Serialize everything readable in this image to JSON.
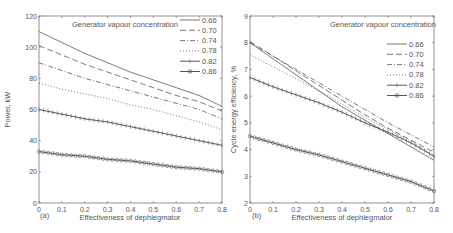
{
  "chart_data": [
    {
      "type": "line",
      "panel_label": "(a)",
      "title": "Generator vapour concentration",
      "xlabel": "Effectiveness of dephlegmator",
      "ylabel": "Power, kW",
      "xlim": [
        0,
        0.8
      ],
      "ylim": [
        0,
        120
      ],
      "xticks": [
        "0",
        "0.1",
        "0.2",
        "0.3",
        "0.4",
        "0.5",
        "0.6",
        "0.7",
        "0.8"
      ],
      "yticks": [
        "0",
        "20",
        "40",
        "60",
        "80",
        "100",
        "120"
      ],
      "grid": false,
      "legend_position": "upper right",
      "x": [
        0,
        0.1,
        0.2,
        0.3,
        0.4,
        0.5,
        0.6,
        0.7,
        0.8
      ],
      "series": [
        {
          "name": "0.66",
          "style": "solid",
          "values": [
            110,
            103,
            96,
            90,
            84,
            79,
            74,
            69,
            62
          ]
        },
        {
          "name": "0.70",
          "style": "dashed",
          "values": [
            101,
            95,
            89,
            84,
            79,
            74,
            69,
            65,
            59
          ]
        },
        {
          "name": "0.74",
          "style": "dashdot",
          "values": [
            90,
            85,
            80,
            76,
            72,
            68,
            64,
            60,
            54
          ]
        },
        {
          "name": "0.78",
          "style": "dotted",
          "values": [
            77,
            73,
            70,
            67,
            63,
            60,
            56,
            52,
            47
          ]
        },
        {
          "name": "0.82",
          "style": "plus",
          "values": [
            60,
            57,
            54,
            52,
            49,
            46,
            43,
            40,
            37
          ]
        },
        {
          "name": "0.86",
          "style": "circle",
          "values": [
            33,
            31,
            30,
            28,
            27,
            25,
            23,
            22,
            20
          ]
        }
      ]
    },
    {
      "type": "line",
      "panel_label": "(b)",
      "title": "Generator vapour concentration",
      "xlabel": "Effectiveness of dephlegmator",
      "ylabel": "Cycle energy efficiency, %",
      "xlim": [
        0,
        0.8
      ],
      "ylim": [
        2,
        9
      ],
      "xticks": [
        "0",
        "0.1",
        "0.2",
        "0.3",
        "0.4",
        "0.5",
        "0.6",
        "0.7",
        "0.8"
      ],
      "yticks": [
        "2",
        "3",
        "4",
        "5",
        "6",
        "7",
        "8",
        "9"
      ],
      "grid": false,
      "legend_position": "upper right",
      "x": [
        0,
        0.1,
        0.2,
        0.3,
        0.4,
        0.5,
        0.6,
        0.7,
        0.8
      ],
      "series": [
        {
          "name": "0.66",
          "style": "solid",
          "values": [
            8.0,
            7.4,
            6.8,
            6.2,
            5.6,
            5.1,
            4.6,
            4.1,
            3.6
          ]
        },
        {
          "name": "0.70",
          "style": "dashed",
          "values": [
            8.05,
            7.5,
            6.95,
            6.4,
            5.85,
            5.3,
            4.8,
            4.35,
            3.9
          ]
        },
        {
          "name": "0.74",
          "style": "dashdot",
          "values": [
            8.0,
            7.5,
            7.0,
            6.5,
            6.0,
            5.5,
            5.0,
            4.55,
            4.1
          ]
        },
        {
          "name": "0.78",
          "style": "dotted",
          "values": [
            7.55,
            7.1,
            6.65,
            6.2,
            5.7,
            5.2,
            4.75,
            4.3,
            3.8
          ]
        },
        {
          "name": "0.82",
          "style": "plus",
          "values": [
            6.7,
            6.35,
            6.05,
            5.75,
            5.4,
            5.0,
            4.65,
            4.25,
            3.75
          ]
        },
        {
          "name": "0.86",
          "style": "circle",
          "values": [
            4.5,
            4.25,
            4.0,
            3.8,
            3.55,
            3.3,
            3.05,
            2.8,
            2.45
          ]
        }
      ]
    }
  ],
  "panels": [
    {
      "label": "(a)",
      "title": "Generator vapour concentration",
      "xlabel": "Effectiveness of dephlegmator",
      "ylabel": "Power, kW"
    },
    {
      "label": "(b)",
      "title": "Generator vapour concentration",
      "xlabel": "Effectiveness of dephlegmator",
      "ylabel": "Cycle energy efficiency, %"
    }
  ],
  "colors": {
    "axis": "#777777",
    "line": "#555555",
    "text": "#555555"
  }
}
